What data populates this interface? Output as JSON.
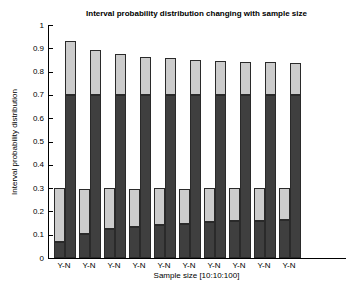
{
  "chart_data": {
    "type": "bar",
    "subtype": "stacked-interval-pairs",
    "title": "Interval probability distribution changing with sample size",
    "xlabel": "Sample size [10:10:100]",
    "ylabel": "Interval probability distribution",
    "ylim": [
      0,
      1
    ],
    "ytick_labels": [
      "0",
      "0.1",
      "0.2",
      "0.3",
      "0.4",
      "0.5",
      "0.6",
      "0.7",
      "0.8",
      "0.9",
      "1"
    ],
    "grid": false,
    "legend": "none",
    "group_tick_label": "Y-N",
    "sample_sizes": [
      10,
      20,
      30,
      40,
      50,
      60,
      70,
      80,
      90,
      100
    ],
    "groups": [
      {
        "label": "Y-N",
        "y_interval": [
          0.07,
          0.3
        ],
        "n_interval": [
          0.7,
          0.93
        ]
      },
      {
        "label": "Y-N",
        "y_interval": [
          0.105,
          0.3
        ],
        "n_interval": [
          0.7,
          0.895
        ]
      },
      {
        "label": "Y-N",
        "y_interval": [
          0.125,
          0.3
        ],
        "n_interval": [
          0.7,
          0.875
        ]
      },
      {
        "label": "Y-N",
        "y_interval": [
          0.135,
          0.3
        ],
        "n_interval": [
          0.7,
          0.865
        ]
      },
      {
        "label": "Y-N",
        "y_interval": [
          0.143,
          0.3
        ],
        "n_interval": [
          0.7,
          0.857
        ]
      },
      {
        "label": "Y-N",
        "y_interval": [
          0.148,
          0.3
        ],
        "n_interval": [
          0.7,
          0.852
        ]
      },
      {
        "label": "Y-N",
        "y_interval": [
          0.153,
          0.3
        ],
        "n_interval": [
          0.7,
          0.847
        ]
      },
      {
        "label": "Y-N",
        "y_interval": [
          0.157,
          0.3
        ],
        "n_interval": [
          0.7,
          0.843
        ]
      },
      {
        "label": "Y-N",
        "y_interval": [
          0.16,
          0.3
        ],
        "n_interval": [
          0.7,
          0.84
        ]
      },
      {
        "label": "Y-N",
        "y_interval": [
          0.162,
          0.3
        ],
        "n_interval": [
          0.7,
          0.838
        ]
      }
    ],
    "colors": {
      "dark_segment": "#3f3f3f",
      "light_segment": "#cccccc",
      "edge": "#2a2a2a",
      "axis": "#000000",
      "text": "#000000",
      "background": "#ffffff"
    }
  }
}
